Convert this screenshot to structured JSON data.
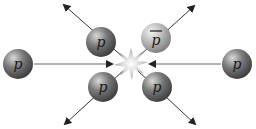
{
  "diagram": {
    "particles": [
      {
        "id": "incoming-left",
        "label": "p",
        "cx": 18,
        "cy": 64,
        "shade": "dark"
      },
      {
        "id": "incoming-right",
        "label": "p",
        "cx": 237,
        "cy": 64,
        "shade": "dark"
      },
      {
        "id": "out-upper-left",
        "label": "p",
        "cx": 101,
        "cy": 42,
        "shade": "dark"
      },
      {
        "id": "out-lower-left",
        "label": "p",
        "cx": 103,
        "cy": 87,
        "shade": "dark"
      },
      {
        "id": "out-upper-right",
        "label": "p",
        "cx": 156,
        "cy": 38,
        "shade": "light",
        "antiparticle": true
      },
      {
        "id": "out-lower-right",
        "label": "p",
        "cx": 157,
        "cy": 87,
        "shade": "dark"
      }
    ],
    "collision_point": {
      "cx": 131,
      "cy": 64
    },
    "colors": {
      "arrow": "#222222",
      "dark_particle": "#6a6a6a",
      "light_particle": "#b5b5b5",
      "burst": "#cfcfcf"
    }
  }
}
